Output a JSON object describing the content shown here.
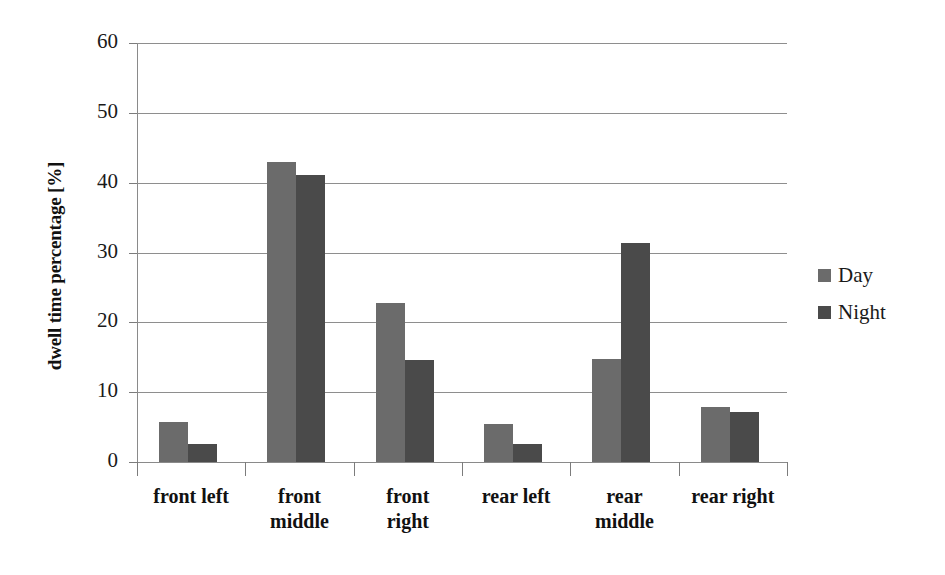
{
  "chart_data": {
    "type": "bar",
    "title": "",
    "xlabel": "",
    "ylabel": "dwell time percentage [%]",
    "ylim": [
      0,
      60
    ],
    "yticks": [
      0,
      10,
      20,
      30,
      40,
      50,
      60
    ],
    "ytick_labels": [
      "0",
      "10",
      "20",
      "30",
      "40",
      "50",
      "60"
    ],
    "grid": true,
    "legend_position": "right",
    "categories": [
      "front left",
      "front middle",
      "front right",
      "rear left",
      "rear middle",
      "rear right"
    ],
    "category_lines": [
      [
        "front left"
      ],
      [
        "front",
        "middle"
      ],
      [
        "front",
        "right"
      ],
      [
        "rear left"
      ],
      [
        "rear",
        "middle"
      ],
      [
        "rear right"
      ]
    ],
    "series": [
      {
        "name": "Day",
        "color": "#6b6b6b",
        "values": [
          5.7,
          43.0,
          22.7,
          5.5,
          14.7,
          7.9
        ]
      },
      {
        "name": "Night",
        "color": "#4a4a4a",
        "values": [
          2.6,
          41.1,
          14.6,
          2.6,
          31.3,
          7.2
        ]
      }
    ]
  },
  "legend": {
    "items": [
      {
        "label": "Day",
        "color": "#6b6b6b"
      },
      {
        "label": "Night",
        "color": "#4a4a4a"
      }
    ]
  }
}
